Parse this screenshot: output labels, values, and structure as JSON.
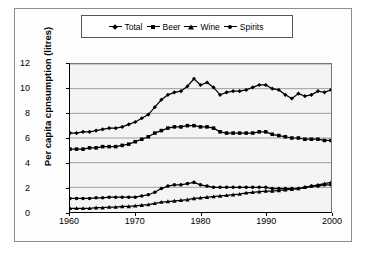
{
  "chart_data": {
    "type": "line",
    "title": "",
    "xlabel": "",
    "ylabel": "Per capita cpnsumption (litres)",
    "xlim": [
      1960,
      2000
    ],
    "ylim": [
      0,
      12
    ],
    "xticks": [
      "1960",
      "1970",
      "1980",
      "1990",
      "2000"
    ],
    "yticks": [
      "0",
      "2",
      "4",
      "6",
      "8",
      "10",
      "12"
    ],
    "grid": "horizontal",
    "legend_position": "top",
    "x": [
      1960,
      1961,
      1962,
      1963,
      1964,
      1965,
      1966,
      1967,
      1968,
      1969,
      1970,
      1971,
      1972,
      1973,
      1974,
      1975,
      1976,
      1977,
      1978,
      1979,
      1980,
      1981,
      1982,
      1983,
      1984,
      1985,
      1986,
      1987,
      1988,
      1989,
      1990,
      1991,
      1992,
      1993,
      1994,
      1995,
      1996,
      1997,
      1998,
      1999,
      2000
    ],
    "series": [
      {
        "name": "Total",
        "marker": "diamond",
        "color": "#000000",
        "values": [
          6.4,
          6.4,
          6.5,
          6.5,
          6.6,
          6.7,
          6.8,
          6.8,
          6.9,
          7.1,
          7.3,
          7.6,
          7.9,
          8.5,
          9.1,
          9.5,
          9.7,
          9.8,
          10.2,
          10.8,
          10.3,
          10.5,
          10.1,
          9.5,
          9.7,
          9.8,
          9.8,
          9.9,
          10.1,
          10.3,
          10.3,
          10.0,
          9.9,
          9.5,
          9.2,
          9.6,
          9.4,
          9.5,
          9.8,
          9.7,
          9.9
        ]
      },
      {
        "name": "Beer",
        "marker": "square",
        "color": "#000000",
        "values": [
          5.1,
          5.1,
          5.1,
          5.2,
          5.2,
          5.3,
          5.3,
          5.3,
          5.4,
          5.5,
          5.7,
          5.9,
          6.1,
          6.4,
          6.6,
          6.8,
          6.9,
          6.9,
          7.0,
          7.0,
          6.9,
          6.9,
          6.8,
          6.5,
          6.4,
          6.4,
          6.4,
          6.4,
          6.4,
          6.5,
          6.5,
          6.3,
          6.2,
          6.1,
          6.0,
          6.0,
          5.9,
          5.9,
          5.9,
          5.8,
          5.8
        ]
      },
      {
        "name": "Wine",
        "marker": "triangle",
        "color": "#000000",
        "values": [
          0.3,
          0.3,
          0.3,
          0.3,
          0.35,
          0.35,
          0.4,
          0.4,
          0.45,
          0.45,
          0.5,
          0.55,
          0.6,
          0.7,
          0.8,
          0.85,
          0.9,
          0.95,
          1.0,
          1.1,
          1.15,
          1.2,
          1.25,
          1.3,
          1.35,
          1.4,
          1.45,
          1.55,
          1.6,
          1.65,
          1.7,
          1.7,
          1.75,
          1.8,
          1.85,
          1.9,
          2.0,
          2.1,
          2.2,
          2.3,
          2.4
        ]
      },
      {
        "name": "Spirits",
        "marker": "circle",
        "color": "#000000",
        "values": [
          1.1,
          1.1,
          1.1,
          1.1,
          1.15,
          1.15,
          1.2,
          1.2,
          1.2,
          1.2,
          1.2,
          1.3,
          1.4,
          1.6,
          1.9,
          2.1,
          2.2,
          2.2,
          2.3,
          2.4,
          2.2,
          2.1,
          2.0,
          2.0,
          2.0,
          2.0,
          2.0,
          2.0,
          2.0,
          2.0,
          2.0,
          1.9,
          1.9,
          1.9,
          1.9,
          1.9,
          2.0,
          2.1,
          2.1,
          2.2,
          2.2
        ]
      }
    ]
  },
  "legend": {
    "items": [
      {
        "label": "Total",
        "marker": "diamond"
      },
      {
        "label": "Beer",
        "marker": "square"
      },
      {
        "label": "Wine",
        "marker": "triangle"
      },
      {
        "label": "Spirits",
        "marker": "circle"
      }
    ]
  }
}
